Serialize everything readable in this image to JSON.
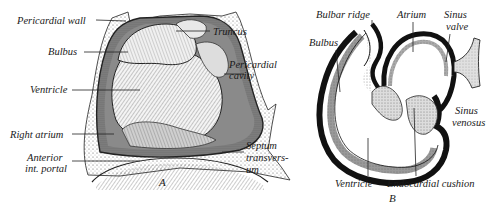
{
  "figure_a": {
    "caption": "A",
    "labels": {
      "pericardial_wall": "Pericardial wall",
      "truncus": "Truncus",
      "bulbus": "Bulbus",
      "pericardial_cavity_1": "Pericardial",
      "pericardial_cavity_2": "cavity",
      "ventricle": "Ventricle",
      "right_atrium": "Right atrium",
      "anterior_portal_1": "Anterior",
      "anterior_portal_2": "int. portal",
      "septum_1": "Septum",
      "septum_2": "transvers-",
      "septum_3": "um"
    }
  },
  "figure_b": {
    "caption": "B",
    "labels": {
      "bulbar_ridge": "Bulbar ridge",
      "atrium": "Atrium",
      "sinus_valve_1": "Sinus",
      "sinus_valve_2": "valve",
      "bulbus": "Bulbus",
      "sinus_venosus_1": "Sinus",
      "sinus_venosus_2": "venosus",
      "ventricle": "Ventricle",
      "endocardial_cushion": "Endocardial cushion"
    }
  },
  "colors": {
    "ink": "#1a1a1a",
    "stipple": "#d9d9d9",
    "shade_dark": "#555555",
    "paper": "#ffffff"
  }
}
